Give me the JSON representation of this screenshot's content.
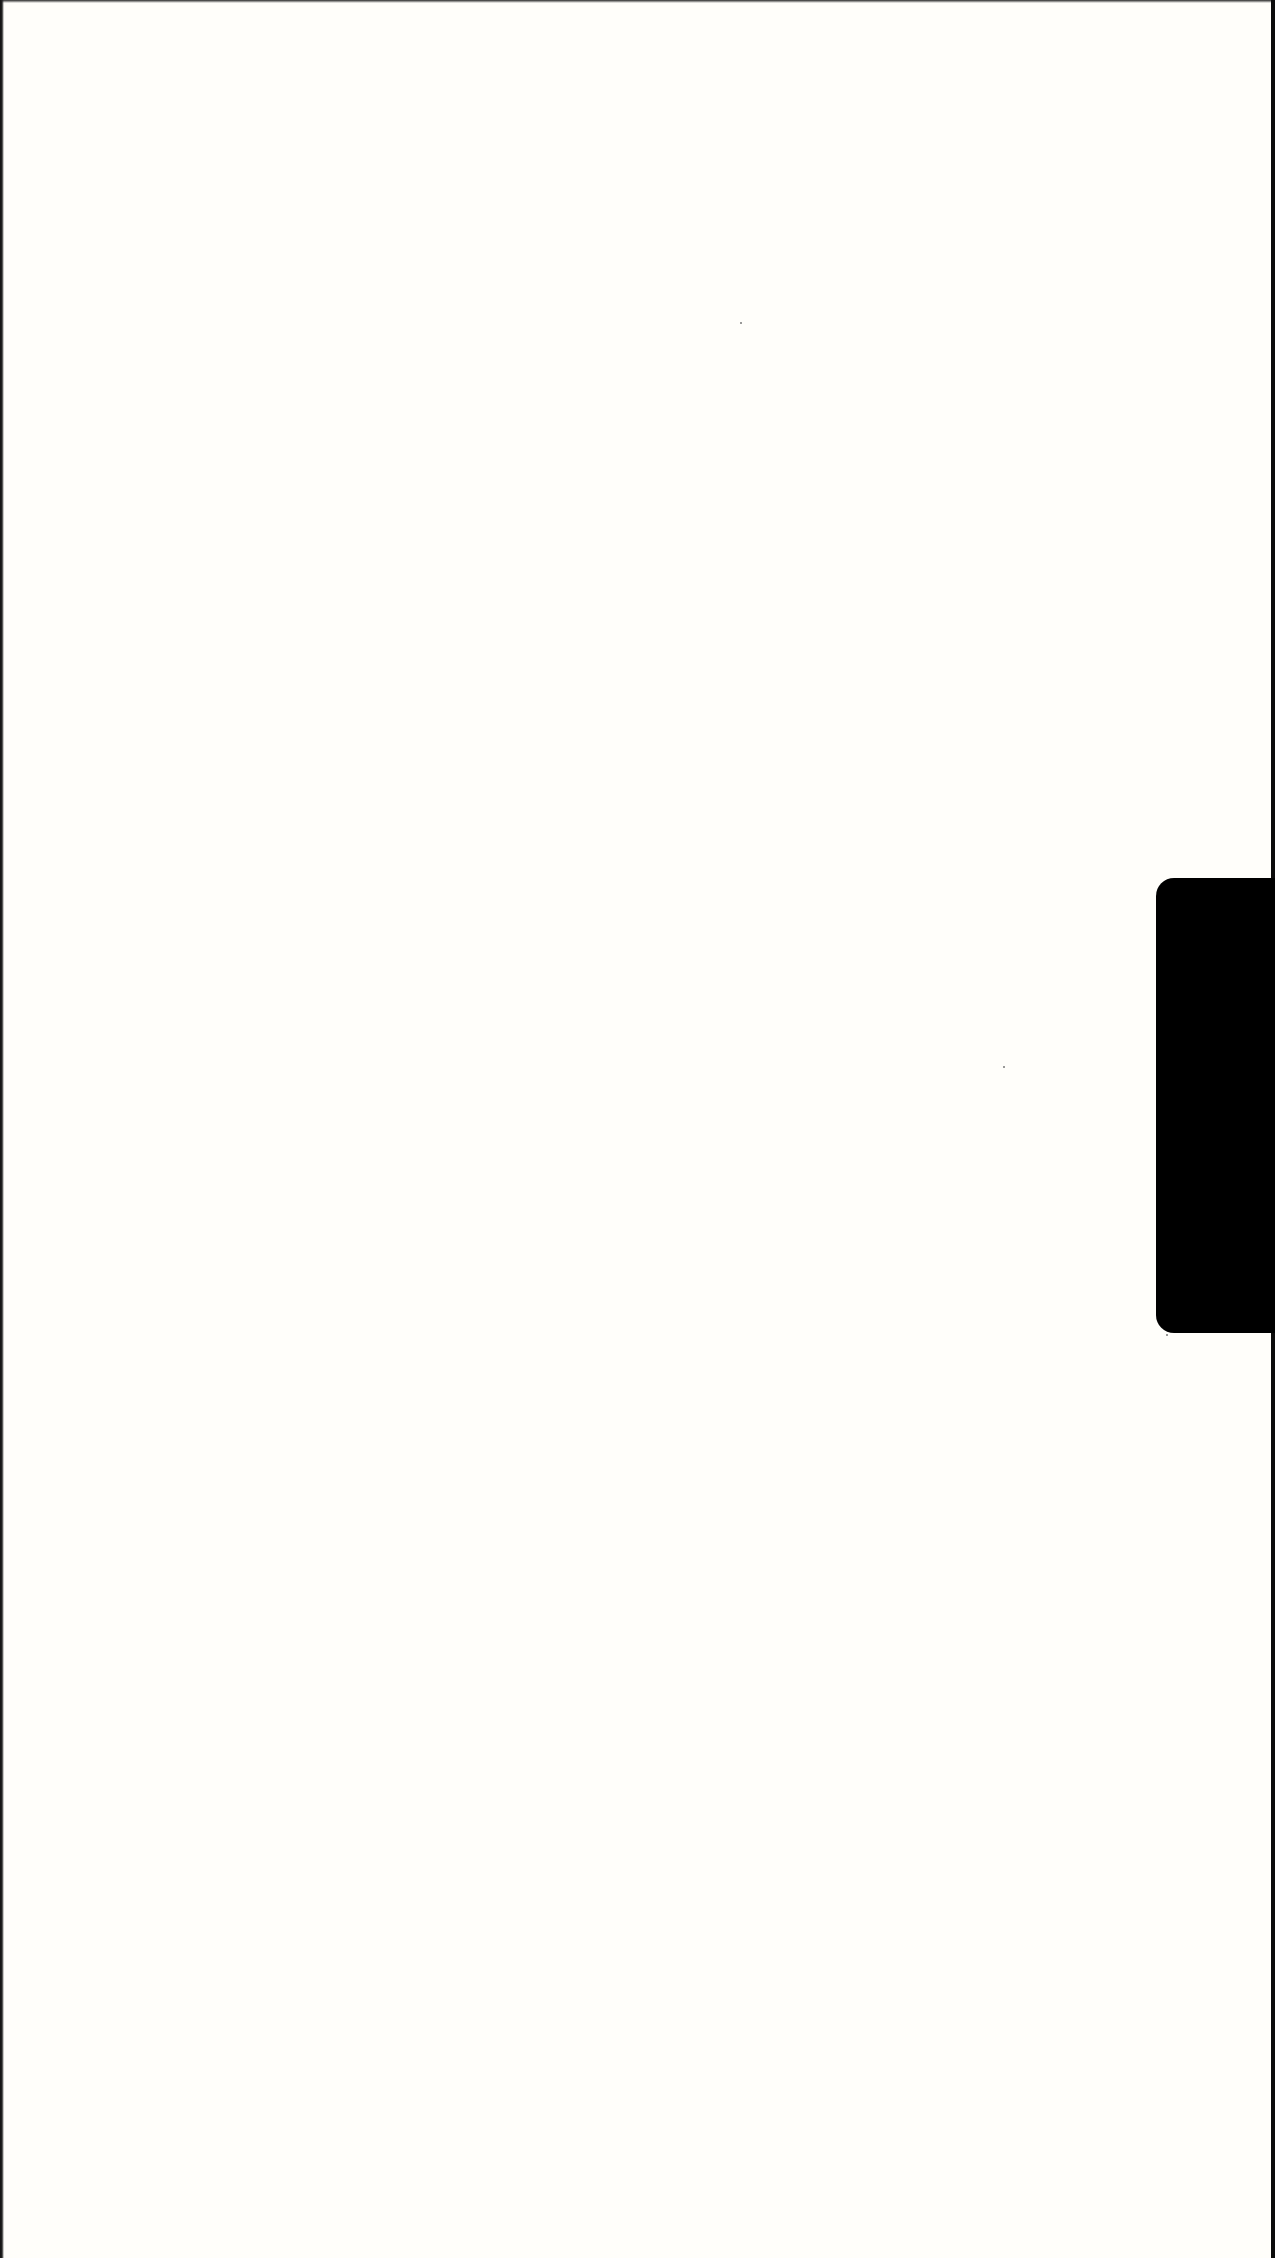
{
  "document": {
    "type": "scanned blank page",
    "background_color": "#fffefa",
    "text_content": ""
  },
  "index_tab": {
    "color": "#000000",
    "label": ""
  },
  "edges": {
    "left_color": "#111111",
    "right_color": "#0b0b0b"
  }
}
